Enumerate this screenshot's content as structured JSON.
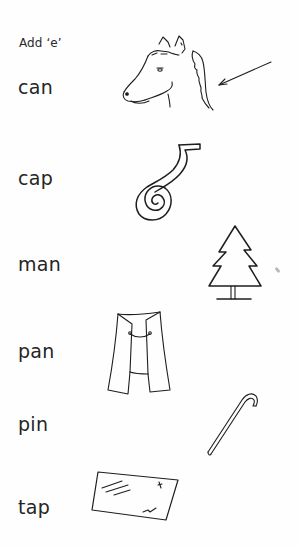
{
  "worksheet": {
    "instruction": "Add ‘e’",
    "rows": [
      {
        "word": "can",
        "picture": "horse-head-with-mane-arrow"
      },
      {
        "word": "cap",
        "picture": "coiled-tape"
      },
      {
        "word": "man",
        "picture": "fir-tree"
      },
      {
        "word": "pan",
        "picture": "cape-cloak"
      },
      {
        "word": "pin",
        "picture": "walking-cane"
      },
      {
        "word": "tap",
        "picture": "window-tape"
      }
    ]
  }
}
